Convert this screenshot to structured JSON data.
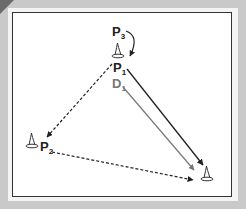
{
  "diagram": {
    "labels": {
      "p3": "P",
      "p3_sub": "3",
      "p1": "P",
      "p1_sub": "1",
      "d1": "D",
      "d1_sub": "1",
      "p2": "P",
      "p2_sub": "2"
    },
    "colors": {
      "background": "#c9c9c9",
      "field": "#ffffff",
      "border": "#333333",
      "player_arrow": "#222222",
      "defender_arrow": "#777777",
      "defender_label": "#777777"
    },
    "cones": [
      {
        "id": "top",
        "x": 118,
        "y": 56
      },
      {
        "id": "left",
        "x": 32,
        "y": 145
      },
      {
        "id": "bottom-right",
        "x": 207,
        "y": 178
      }
    ]
  }
}
